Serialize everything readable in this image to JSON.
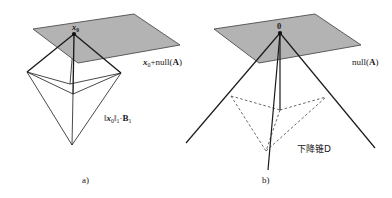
{
  "figure": {
    "background_color": "#ffffff",
    "plane_fill_color": "#b3b3b3",
    "plane_stroke_color": "#4d4d4d",
    "line_color": "#1a1a1a",
    "dashed_line_color": "#4d4d4d",
    "panels": [
      {
        "caption": "a)",
        "point_label": "x₀",
        "plane_label": "x₀+null(A)",
        "body_label": "‖x₀‖₁·B₁"
      },
      {
        "caption": "b)",
        "point_label": "0",
        "plane_label": "null(A)",
        "body_label": "下降锥D"
      }
    ]
  },
  "labels": {
    "x0_point": "x",
    "x0_point_sub": "0",
    "zero_point": "0",
    "affine_subspace_prefix": "x",
    "affine_subspace_sub": "0",
    "affine_subspace_mid": "+null(",
    "affine_subspace_matrix": "A",
    "affine_subspace_suffix": ")",
    "nullspace_prefix": "null(",
    "nullspace_matrix": "A",
    "nullspace_suffix": ")",
    "l1_ball_norm_open": "‖",
    "l1_ball_var": "x",
    "l1_ball_var_sub": "0",
    "l1_ball_norm_close": "‖",
    "l1_ball_norm_sub": "1",
    "l1_ball_dot": "·",
    "l1_ball_set": "B",
    "l1_ball_set_sub": "1",
    "descent_cone": "下降锥D",
    "panel_a_caption": "a)",
    "panel_b_caption": "b)"
  },
  "geometry": {
    "panel_a": {
      "plane_polygon": "33,29 134,14 180,45 78,63",
      "apex": "74,34",
      "octa_top": "70,84",
      "octa_left": "27,72",
      "octa_right": "121,73",
      "octa_bottom": "72,145",
      "octa_front": "73,94"
    },
    "panel_b": {
      "plane_polygon": "214,29 315,14 361,45 259,63",
      "apex": "280,33",
      "cone_left_end": "186,143",
      "cone_right_end": "375,148",
      "cone_axis_end": "268,170",
      "cone_rim_left": "231,96",
      "cone_rim_right": "326,97",
      "cone_rim_front": "266,151",
      "cone_rim_back": "280,110"
    }
  }
}
